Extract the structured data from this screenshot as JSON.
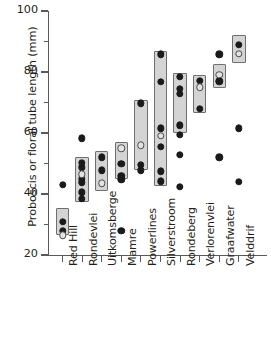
{
  "chart_data": {
    "type": "scatter",
    "title": "",
    "xlabel": "",
    "ylabel": "Proboscis or floral tube length (mm)",
    "ylim": [
      20,
      100
    ],
    "y_major_ticks": [
      20,
      40,
      60,
      80,
      100
    ],
    "y_minor_ticks": [
      30,
      50,
      70,
      90
    ],
    "grid": false,
    "legend_position": "none",
    "marker_types": {
      "closed": "filled black circle",
      "open": "open grey-outlined circle"
    },
    "categories": [
      "Red Hill",
      "Rondevlei",
      "Uitkomsberge",
      "Mamre",
      "Powerlines",
      "Silverstroom",
      "Rondeberg",
      "Verlorenvlei",
      "Graafwater",
      "Velddrif"
    ],
    "groups": [
      {
        "name": "Red Hill",
        "box_range": [
          26.5,
          35.5
        ],
        "closed_points": [
          43.0,
          30.8,
          28.0
        ],
        "open_points": [
          26.5
        ]
      },
      {
        "name": "Rondevlei",
        "box_range": [
          37.5,
          52.0
        ],
        "closed_points": [
          58.2,
          50.3,
          48.7,
          45.0,
          43.8,
          40.5,
          38.5
        ],
        "open_points": [
          46.5
        ]
      },
      {
        "name": "Uitkomsberge",
        "box_range": [
          41.0,
          54.2
        ],
        "closed_points": [
          52.0,
          47.8
        ],
        "open_points": [
          43.5
        ]
      },
      {
        "name": "Mamre",
        "box_range": [
          44.8,
          57.0
        ],
        "closed_points": [
          50.0,
          46.0,
          44.8,
          28.0
        ],
        "open_points": [
          55.0
        ]
      },
      {
        "name": "Powerlines",
        "box_range": [
          47.8,
          70.8
        ],
        "closed_points": [
          69.8,
          49.5,
          47.8
        ],
        "open_points": [
          56.0
        ]
      },
      {
        "name": "Silverstroom",
        "box_range": [
          42.5,
          87.0
        ],
        "closed_points": [
          85.8,
          76.8,
          61.5,
          55.5,
          47.5,
          44.2
        ],
        "open_points": [
          59.0
        ]
      },
      {
        "name": "Rondeberg",
        "box_range": [
          60.0,
          79.8
        ],
        "closed_points": [
          78.5,
          74.5,
          72.8,
          62.5,
          59.5,
          52.8,
          42.3
        ],
        "open_points": []
      },
      {
        "name": "Verlorenvlei",
        "box_range": [
          66.5,
          79.0
        ],
        "closed_points": [
          77.2,
          68.0
        ],
        "open_points": [
          75.0
        ]
      },
      {
        "name": "Graafwater",
        "box_range": [
          74.8,
          82.5
        ],
        "closed_points": [
          85.8,
          77.0,
          52.0
        ],
        "open_points": [
          79.0
        ]
      },
      {
        "name": "Velddrif",
        "box_range": [
          82.8,
          92.0
        ],
        "closed_points": [
          89.0,
          61.5,
          44.0
        ],
        "open_points": [
          86.0
        ]
      }
    ]
  }
}
